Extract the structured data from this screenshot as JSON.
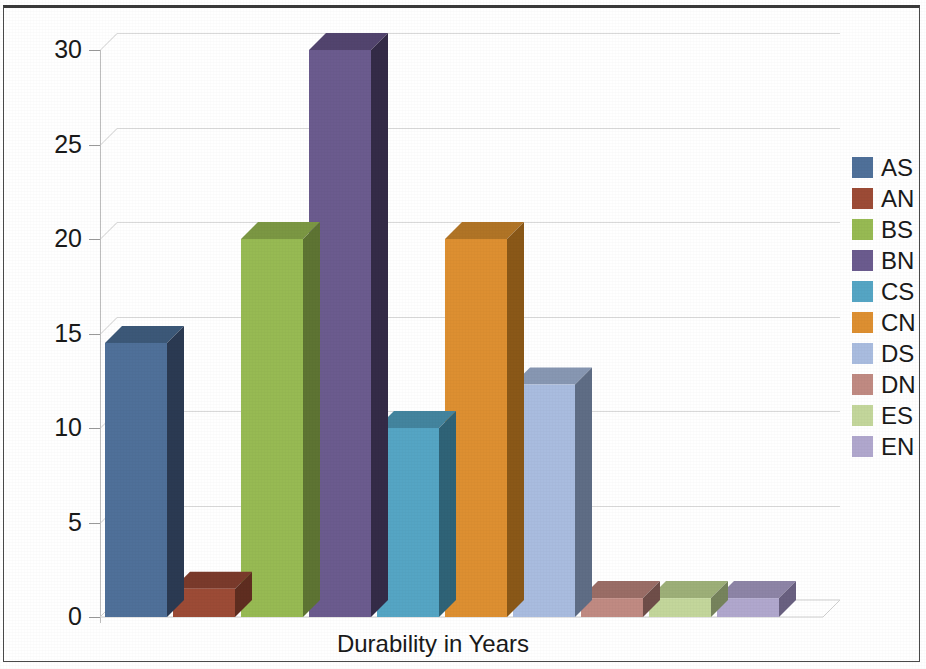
{
  "chart_data": {
    "type": "bar",
    "title": "",
    "subtitle": "",
    "xlabel": "Durability in Years",
    "ylabel": "",
    "categories": [
      "AS",
      "AN",
      "BS",
      "BN",
      "CS",
      "CN",
      "DS",
      "DN",
      "ES",
      "EN"
    ],
    "values": [
      14.5,
      1.5,
      20,
      30,
      10,
      20,
      12.3,
      1,
      1,
      1
    ],
    "series": [
      {
        "name": "Durability in Years",
        "values": [
          14.5,
          1.5,
          20,
          30,
          10,
          20,
          12.3,
          1,
          1,
          1
        ]
      }
    ],
    "ylim": [
      0,
      30
    ],
    "ytick_labels": [
      "0",
      "5",
      "10",
      "15",
      "20",
      "25",
      "30"
    ],
    "ytick_values": [
      0,
      5,
      10,
      15,
      20,
      25,
      30
    ],
    "grid": true,
    "legend_position": "right",
    "three_d": true,
    "colors": [
      "#4f7099",
      "#9c4b36",
      "#97ba53",
      "#6b5b8e",
      "#55a5c4",
      "#dd8f31",
      "#a9bcdf",
      "#c08a82",
      "#c3d69b",
      "#b0a7cd"
    ],
    "side_colors": [
      "#2b3a52",
      "#5f2d20",
      "#5e7433",
      "#342b47",
      "#2f6377",
      "#8a5818",
      "#5f6d85",
      "#6f4e49",
      "#76835c",
      "#696080"
    ],
    "top_colors": [
      "#3c5878",
      "#7a3a2b",
      "#7b9743",
      "#52446e",
      "#43849e",
      "#b07426",
      "#8797b2",
      "#9a6d66",
      "#9daf78",
      "#8d84a6"
    ]
  },
  "legend": {
    "items": [
      {
        "label": "AS",
        "color": "#4f7099"
      },
      {
        "label": "AN",
        "color": "#9c4b36"
      },
      {
        "label": "BS",
        "color": "#97ba53"
      },
      {
        "label": "BN",
        "color": "#6b5b8e"
      },
      {
        "label": "CS",
        "color": "#55a5c4"
      },
      {
        "label": "CN",
        "color": "#dd8f31"
      },
      {
        "label": "DS",
        "color": "#a9bcdf"
      },
      {
        "label": "DN",
        "color": "#c08a82"
      },
      {
        "label": "ES",
        "color": "#c3d69b"
      },
      {
        "label": "EN",
        "color": "#b0a7cd"
      }
    ]
  },
  "axis": {
    "x_title": "Durability in Years",
    "y_labels": [
      "30",
      "25",
      "20",
      "15",
      "10",
      "5",
      "0"
    ]
  }
}
